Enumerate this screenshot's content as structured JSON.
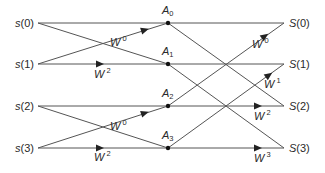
{
  "inputs": [
    {
      "name": "s",
      "index": "(0)",
      "x": 38,
      "y": 23
    },
    {
      "name": "s",
      "index": "(1)",
      "x": 38,
      "y": 64
    },
    {
      "name": "s",
      "index": "(2)",
      "x": 38,
      "y": 106
    },
    {
      "name": "s",
      "index": "(3)",
      "x": 38,
      "y": 148
    }
  ],
  "intermediate": [
    {
      "name": "A",
      "sub": "0",
      "x": 168,
      "y": 23
    },
    {
      "name": "A",
      "sub": "1",
      "x": 168,
      "y": 64
    },
    {
      "name": "A",
      "sub": "2",
      "x": 168,
      "y": 106
    },
    {
      "name": "A",
      "sub": "3",
      "x": 168,
      "y": 148
    }
  ],
  "outputs": [
    {
      "name": "S",
      "index": "(0)",
      "x": 284,
      "y": 23
    },
    {
      "name": "S",
      "index": "(1)",
      "x": 284,
      "y": 64
    },
    {
      "name": "S",
      "index": "(2)",
      "x": 284,
      "y": 106
    },
    {
      "name": "S",
      "index": "(3)",
      "x": 284,
      "y": 148
    }
  ],
  "weights": [
    {
      "base": "W",
      "exp": "0",
      "x": 110,
      "y": 46
    },
    {
      "base": "W",
      "exp": "2",
      "x": 94,
      "y": 78
    },
    {
      "base": "W",
      "exp": "0",
      "x": 110,
      "y": 130
    },
    {
      "base": "W",
      "exp": "2",
      "x": 94,
      "y": 161
    },
    {
      "base": "W",
      "exp": "0",
      "x": 252,
      "y": 48
    },
    {
      "base": "W",
      "exp": "1",
      "x": 264,
      "y": 88
    },
    {
      "base": "W",
      "exp": "2",
      "x": 254,
      "y": 120
    },
    {
      "base": "W",
      "exp": "3",
      "x": 254,
      "y": 162
    }
  ],
  "edges": [
    {
      "from": [
        38,
        23
      ],
      "to": [
        168,
        23
      ]
    },
    {
      "from": [
        38,
        23
      ],
      "to": [
        168,
        64
      ]
    },
    {
      "from": [
        38,
        64
      ],
      "to": [
        168,
        23
      ],
      "arrow": [
        145,
        30
      ]
    },
    {
      "from": [
        38,
        64
      ],
      "to": [
        168,
        64
      ],
      "arrow": [
        100,
        64
      ]
    },
    {
      "from": [
        38,
        106
      ],
      "to": [
        168,
        106
      ]
    },
    {
      "from": [
        38,
        106
      ],
      "to": [
        168,
        148
      ]
    },
    {
      "from": [
        38,
        148
      ],
      "to": [
        168,
        106
      ],
      "arrow": [
        145,
        113
      ]
    },
    {
      "from": [
        38,
        148
      ],
      "to": [
        168,
        148
      ],
      "arrow": [
        100,
        148
      ]
    },
    {
      "from": [
        168,
        23
      ],
      "to": [
        284,
        23
      ]
    },
    {
      "from": [
        168,
        23
      ],
      "to": [
        284,
        106
      ]
    },
    {
      "from": [
        168,
        64
      ],
      "to": [
        284,
        64
      ]
    },
    {
      "from": [
        168,
        64
      ],
      "to": [
        284,
        148
      ]
    },
    {
      "from": [
        168,
        106
      ],
      "to": [
        284,
        23
      ],
      "arrow": [
        265,
        36
      ]
    },
    {
      "from": [
        168,
        106
      ],
      "to": [
        284,
        106
      ],
      "arrow": [
        258,
        106
      ]
    },
    {
      "from": [
        168,
        148
      ],
      "to": [
        284,
        64
      ],
      "arrow": [
        269,
        75
      ]
    },
    {
      "from": [
        168,
        148
      ],
      "to": [
        284,
        148
      ],
      "arrow": [
        258,
        148
      ]
    }
  ]
}
